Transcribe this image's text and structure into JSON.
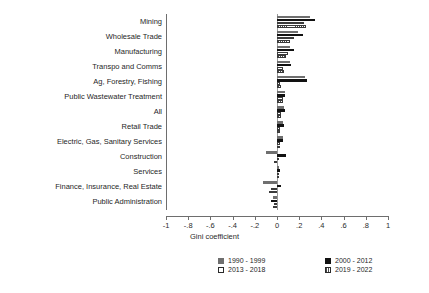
{
  "chart_data": {
    "type": "bar",
    "orientation": "horizontal",
    "title": "",
    "xlabel": "Gini coefficient",
    "ylabel": "",
    "xlim": [
      -1,
      1
    ],
    "xticks": [
      -1,
      -0.8,
      -0.6,
      -0.4,
      -0.2,
      0,
      0.2,
      0.4,
      0.6,
      0.8,
      1
    ],
    "xtick_labels": [
      "-1",
      "-.8",
      "-.6",
      "-.4",
      "-.2",
      "0",
      ".2",
      ".4",
      ".6",
      ".8",
      "1"
    ],
    "grid": false,
    "legend_position": "bottom",
    "categories": [
      "Mining",
      "Wholesale Trade",
      "Manufacturing",
      "Transpo and Comms",
      "Ag, Forestry, Fishing",
      "Public Wastewater Treatment",
      "All",
      "Retail Trade",
      "Electric, Gas, Sanitary Services",
      "Construction",
      "Services",
      "Finance, Insurance, Real Estate",
      "Public Administration"
    ],
    "series": [
      {
        "name": "1990 - 1999",
        "color": "#6f6f6f",
        "values": [
          0.3,
          0.19,
          0.12,
          0.12,
          0.25,
          0.07,
          0.06,
          0.05,
          0.05,
          -0.1,
          0.02,
          -0.13,
          -0.04
        ]
      },
      {
        "name": "2000 - 2012",
        "color": "#121212",
        "values": [
          0.34,
          0.23,
          0.15,
          0.13,
          0.27,
          0.07,
          0.07,
          0.06,
          0.05,
          0.08,
          0.03,
          0.04,
          -0.05
        ]
      },
      {
        "name": "2013 - 2018",
        "color": "#ffffff",
        "values": [
          0.24,
          0.15,
          0.1,
          0.05,
          0.03,
          0.05,
          0.04,
          0.03,
          0.03,
          0.02,
          0.02,
          -0.05,
          -0.03
        ]
      },
      {
        "name": "2019 - 2022",
        "color": "#ffffff",
        "values": [
          0.26,
          0.12,
          0.08,
          0.06,
          0.04,
          0.05,
          0.04,
          0.03,
          0.03,
          -0.03,
          0.01,
          -0.07,
          -0.04
        ]
      }
    ]
  },
  "legend": {
    "entries": [
      {
        "label": "1990 - 1999",
        "swatch": "grey-filled-square-icon"
      },
      {
        "label": "2000 - 2012",
        "swatch": "black-filled-square-icon"
      },
      {
        "label": "2013 - 2018",
        "swatch": "hollow-square-icon"
      },
      {
        "label": "2019 - 2022",
        "swatch": "hatched-square-icon"
      }
    ]
  }
}
